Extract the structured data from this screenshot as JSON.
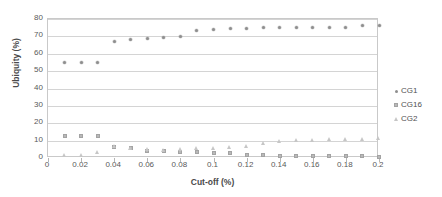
{
  "chart_data": {
    "type": "scatter",
    "title": "",
    "xlabel": "Cut-off (%)",
    "ylabel": "Ubiquity (%)",
    "xlim": [
      0,
      0.2
    ],
    "ylim": [
      0,
      80
    ],
    "xticks": [
      "0",
      "0.02",
      "0.04",
      "0.06",
      "0.08",
      "0.1",
      "0.12",
      "0.14",
      "0.16",
      "0.18",
      "0.2"
    ],
    "xtick_values": [
      0,
      0.02,
      0.04,
      0.06,
      0.08,
      0.1,
      0.12,
      0.14,
      0.16,
      0.18,
      0.2
    ],
    "yticks": [
      "0",
      "10",
      "20",
      "30",
      "40",
      "50",
      "60",
      "70",
      "80"
    ],
    "ytick_values": [
      0,
      10,
      20,
      30,
      40,
      50,
      60,
      70,
      80
    ],
    "grid": "horizontal",
    "legend_position": "right",
    "x": [
      0.01,
      0.02,
      0.03,
      0.04,
      0.05,
      0.06,
      0.07,
      0.08,
      0.09,
      0.1,
      0.11,
      0.12,
      0.13,
      0.14,
      0.15,
      0.16,
      0.17,
      0.18,
      0.19,
      0.2
    ],
    "series": [
      {
        "name": "CG1",
        "marker": "diamond",
        "color": "#8e8e8e",
        "values": [
          54.8,
          54.8,
          54.8,
          67.0,
          68.0,
          68.7,
          69.5,
          70.2,
          73.3,
          73.8,
          74.5,
          74.8,
          75.2,
          75.2,
          75.2,
          75.2,
          75.2,
          75.3,
          76.0,
          76.0
        ]
      },
      {
        "name": "CG16",
        "marker": "square",
        "color": "#b9b9b9",
        "values": [
          12.5,
          12.5,
          12.5,
          6.5,
          5.8,
          4.2,
          3.8,
          3.7,
          3.5,
          3.0,
          2.7,
          1.6,
          1.5,
          1.4,
          1.2,
          1.1,
          1.1,
          1.0,
          1.0,
          0.8
        ]
      },
      {
        "name": "CG2",
        "marker": "triangle",
        "color": "#c6c6c6",
        "values": [
          1.6,
          1.3,
          3.0,
          6.8,
          5.6,
          4.8,
          4.6,
          4.8,
          5.3,
          5.8,
          6.2,
          6.9,
          8.2,
          9.5,
          10.0,
          10.3,
          10.5,
          10.6,
          10.8,
          11.0
        ]
      }
    ]
  },
  "legend": {
    "entries": [
      {
        "label": "CG1",
        "marker": "diamond"
      },
      {
        "label": "CG16",
        "marker": "square"
      },
      {
        "label": "CG2",
        "marker": "triangle"
      }
    ]
  }
}
